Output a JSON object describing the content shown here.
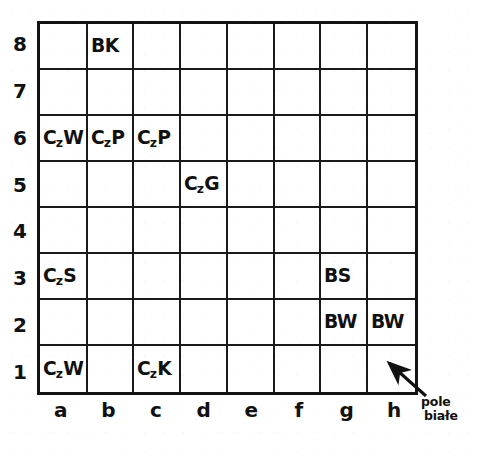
{
  "diagram": {
    "type": "chess-board",
    "rank_labels": [
      "8",
      "7",
      "6",
      "5",
      "4",
      "3",
      "2",
      "1"
    ],
    "file_labels": [
      "a",
      "b",
      "c",
      "d",
      "e",
      "f",
      "g",
      "h"
    ],
    "annotation": {
      "line1": "pole",
      "line2": "białe",
      "full_text": "pole białe",
      "points_to_square": "h1",
      "icon": "arrow-up-left-icon"
    },
    "colors": {
      "ink": "#111111",
      "grid_line": "#1a1a1a",
      "paper": "#ffffff"
    },
    "cells": [
      [
        {
          "square": "a8",
          "label": "",
          "sub": ""
        },
        {
          "square": "b8",
          "label": "BK",
          "sub": ""
        },
        {
          "square": "c8",
          "label": "",
          "sub": ""
        },
        {
          "square": "d8",
          "label": "",
          "sub": ""
        },
        {
          "square": "e8",
          "label": "",
          "sub": ""
        },
        {
          "square": "f8",
          "label": "",
          "sub": ""
        },
        {
          "square": "g8",
          "label": "",
          "sub": ""
        },
        {
          "square": "h8",
          "label": "",
          "sub": ""
        }
      ],
      [
        {
          "square": "a7",
          "label": "",
          "sub": ""
        },
        {
          "square": "b7",
          "label": "",
          "sub": ""
        },
        {
          "square": "c7",
          "label": "",
          "sub": ""
        },
        {
          "square": "d7",
          "label": "",
          "sub": ""
        },
        {
          "square": "e7",
          "label": "",
          "sub": ""
        },
        {
          "square": "f7",
          "label": "",
          "sub": ""
        },
        {
          "square": "g7",
          "label": "",
          "sub": ""
        },
        {
          "square": "h7",
          "label": "",
          "sub": ""
        }
      ],
      [
        {
          "square": "a6",
          "label": "C",
          "sub": "z",
          "tail": "W"
        },
        {
          "square": "b6",
          "label": "C",
          "sub": "z",
          "tail": "P"
        },
        {
          "square": "c6",
          "label": "C",
          "sub": "z",
          "tail": "P"
        },
        {
          "square": "d6",
          "label": "",
          "sub": ""
        },
        {
          "square": "e6",
          "label": "",
          "sub": ""
        },
        {
          "square": "f6",
          "label": "",
          "sub": ""
        },
        {
          "square": "g6",
          "label": "",
          "sub": ""
        },
        {
          "square": "h6",
          "label": "",
          "sub": ""
        }
      ],
      [
        {
          "square": "a5",
          "label": "",
          "sub": ""
        },
        {
          "square": "b5",
          "label": "",
          "sub": ""
        },
        {
          "square": "c5",
          "label": "",
          "sub": ""
        },
        {
          "square": "d5",
          "label": "C",
          "sub": "z",
          "tail": "G"
        },
        {
          "square": "e5",
          "label": "",
          "sub": ""
        },
        {
          "square": "f5",
          "label": "",
          "sub": ""
        },
        {
          "square": "g5",
          "label": "",
          "sub": ""
        },
        {
          "square": "h5",
          "label": "",
          "sub": ""
        }
      ],
      [
        {
          "square": "a4",
          "label": "",
          "sub": ""
        },
        {
          "square": "b4",
          "label": "",
          "sub": ""
        },
        {
          "square": "c4",
          "label": "",
          "sub": ""
        },
        {
          "square": "d4",
          "label": "",
          "sub": ""
        },
        {
          "square": "e4",
          "label": "",
          "sub": ""
        },
        {
          "square": "f4",
          "label": "",
          "sub": ""
        },
        {
          "square": "g4",
          "label": "",
          "sub": ""
        },
        {
          "square": "h4",
          "label": "",
          "sub": ""
        }
      ],
      [
        {
          "square": "a3",
          "label": "C",
          "sub": "z",
          "tail": "S"
        },
        {
          "square": "b3",
          "label": "",
          "sub": ""
        },
        {
          "square": "c3",
          "label": "",
          "sub": ""
        },
        {
          "square": "d3",
          "label": "",
          "sub": ""
        },
        {
          "square": "e3",
          "label": "",
          "sub": ""
        },
        {
          "square": "f3",
          "label": "",
          "sub": ""
        },
        {
          "square": "g3",
          "label": "BS",
          "sub": ""
        },
        {
          "square": "h3",
          "label": "",
          "sub": ""
        }
      ],
      [
        {
          "square": "a2",
          "label": "",
          "sub": ""
        },
        {
          "square": "b2",
          "label": "",
          "sub": ""
        },
        {
          "square": "c2",
          "label": "",
          "sub": ""
        },
        {
          "square": "d2",
          "label": "",
          "sub": ""
        },
        {
          "square": "e2",
          "label": "",
          "sub": ""
        },
        {
          "square": "f2",
          "label": "",
          "sub": ""
        },
        {
          "square": "g2",
          "label": "BW",
          "sub": ""
        },
        {
          "square": "h2",
          "label": "BW",
          "sub": ""
        }
      ],
      [
        {
          "square": "a1",
          "label": "C",
          "sub": "z",
          "tail": "W"
        },
        {
          "square": "b1",
          "label": "",
          "sub": ""
        },
        {
          "square": "c1",
          "label": "C",
          "sub": "z",
          "tail": "K"
        },
        {
          "square": "d1",
          "label": "",
          "sub": ""
        },
        {
          "square": "e1",
          "label": "",
          "sub": ""
        },
        {
          "square": "f1",
          "label": "",
          "sub": ""
        },
        {
          "square": "g1",
          "label": "",
          "sub": ""
        },
        {
          "square": "h1",
          "label": "",
          "sub": ""
        }
      ]
    ]
  }
}
